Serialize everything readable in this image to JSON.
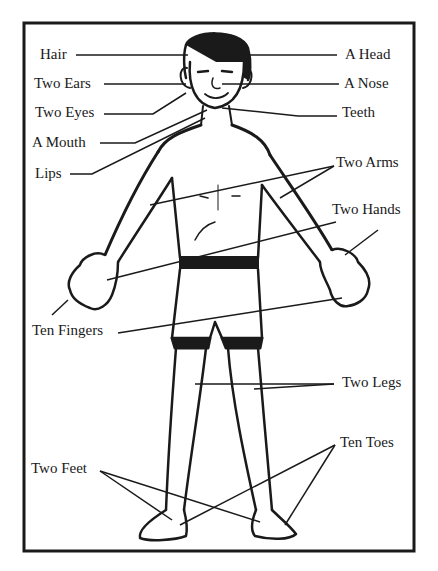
{
  "diagram": {
    "title": "",
    "colors": {
      "ink": "#1a1a1a",
      "background": "#ffffff"
    },
    "labels": {
      "hair": "Hair",
      "two_ears": "Two Ears",
      "two_eyes": "Two Eyes",
      "a_mouth": "A Mouth",
      "lips": "Lips",
      "a_head": "A Head",
      "a_nose": "A Nose",
      "teeth": "Teeth",
      "two_arms": "Two Arms",
      "two_hands": "Two Hands",
      "ten_fingers": "Ten Fingers",
      "two_legs": "Two Legs",
      "ten_toes": "Ten Toes",
      "two_feet": "Two Feet"
    }
  }
}
